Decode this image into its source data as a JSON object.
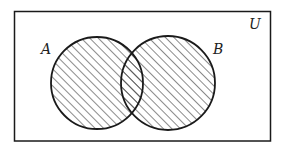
{
  "diagram": {
    "type": "venn",
    "universe_label": "U",
    "sets": [
      {
        "label": "A",
        "shaded": true
      },
      {
        "label": "B",
        "shaded": true
      }
    ],
    "shaded_region": "A ∪ B",
    "colors": {
      "stroke": "#1a1a1a",
      "hatch": "#2a2a2a",
      "background": "#ffffff"
    }
  }
}
